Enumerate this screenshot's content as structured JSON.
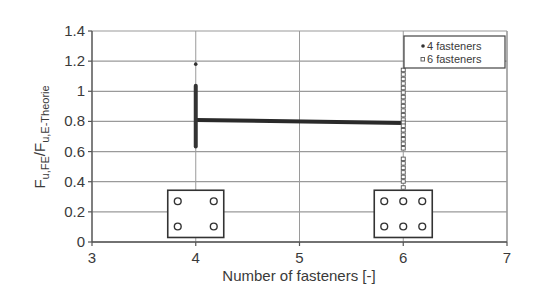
{
  "chart_data": {
    "type": "scatter",
    "title": "",
    "xlabel": "Number of fasteners [-]",
    "ylabel": {
      "main": "F",
      "sub1": "u,FE",
      "slash": "/F",
      "sub2": "u,E-Theorie",
      "full": "F_u,FE / F_u,E-Theorie"
    },
    "xlim": [
      3,
      7
    ],
    "ylim": [
      0,
      1.4
    ],
    "x_ticks": [
      "3",
      "4",
      "5",
      "6",
      "7"
    ],
    "y_ticks": [
      "0",
      "0.2",
      "0.4",
      "0.6",
      "0.8",
      "1",
      "1.2",
      "1.4"
    ],
    "grid": "horizontal",
    "legend_position": "upper right",
    "series": [
      {
        "name": "4 fasteners",
        "marker": "filled-circle",
        "color": "#333333",
        "x": 4,
        "range": [
          0.62,
          1.05
        ],
        "outliers": [
          1.18
        ],
        "values": [
          1.18,
          1.05,
          1.03,
          1.01,
          0.99,
          0.97,
          0.95,
          0.93,
          0.91,
          0.89,
          0.87,
          0.85,
          0.83,
          0.81,
          0.79,
          0.77,
          0.75,
          0.73,
          0.71,
          0.69,
          0.67,
          0.65,
          0.63,
          0.62
        ]
      },
      {
        "name": "6 fasteners",
        "marker": "open-square",
        "color": "#555555",
        "x": 6,
        "range": [
          0.36,
          1.14
        ],
        "values": [
          1.14,
          1.11,
          1.08,
          1.05,
          1.02,
          0.99,
          0.96,
          0.93,
          0.9,
          0.87,
          0.84,
          0.81,
          0.79,
          0.77,
          0.74,
          0.71,
          0.68,
          0.65,
          0.62,
          0.55,
          0.52,
          0.49,
          0.46,
          0.43,
          0.4,
          0.36
        ]
      }
    ],
    "trend_band": {
      "description": "thick horizontal band of mean values",
      "from": {
        "x": 4,
        "y": 0.81
      },
      "to": {
        "x": 6,
        "y": 0.79
      }
    },
    "insets": [
      {
        "label": "4-fastener layout",
        "x_center": 4,
        "y_range": [
          0.03,
          0.35
        ],
        "holes": {
          "rows": 2,
          "cols": 2
        }
      },
      {
        "label": "6-fastener layout",
        "x_center": 6,
        "y_range": [
          0.03,
          0.35
        ],
        "holes": {
          "rows": 2,
          "cols": 3
        }
      }
    ]
  },
  "legend": {
    "items": [
      {
        "label": "4 fasteners",
        "marker": "•"
      },
      {
        "label": "6 fasteners",
        "marker": "▫"
      }
    ]
  }
}
